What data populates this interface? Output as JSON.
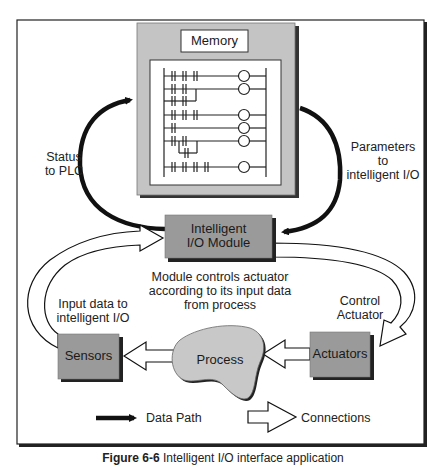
{
  "figure": {
    "caption_prefix": "Figure 6-6",
    "caption_text": "Intelligent I/O interface application"
  },
  "memory": {
    "title": "Memory",
    "ladder_rungs": 7
  },
  "blocks": {
    "io_module_line1": "Intelligent",
    "io_module_line2": "I/O Module",
    "sensors": "Sensors",
    "actuators": "Actuators",
    "process": "Process"
  },
  "annotations": {
    "status_line1": "Status",
    "status_line2": "to PLC",
    "params_line1": "Parameters",
    "params_line2": "to",
    "params_line3": "intelligent I/O",
    "module_desc_line1": "Module controls actuator",
    "module_desc_line2": "according to its input data",
    "module_desc_line3": "from process",
    "input_line1": "Input data to",
    "input_line2": "intelligent I/O",
    "control_line1": "Control",
    "control_line2": "Actuator"
  },
  "legend": {
    "data_path": "Data Path",
    "connections": "Connections"
  },
  "colors": {
    "block_gray": "#9a9a9a",
    "memory_gray": "#c4c4c4",
    "process_gray": "#c8c8c8",
    "line": "#111111"
  }
}
